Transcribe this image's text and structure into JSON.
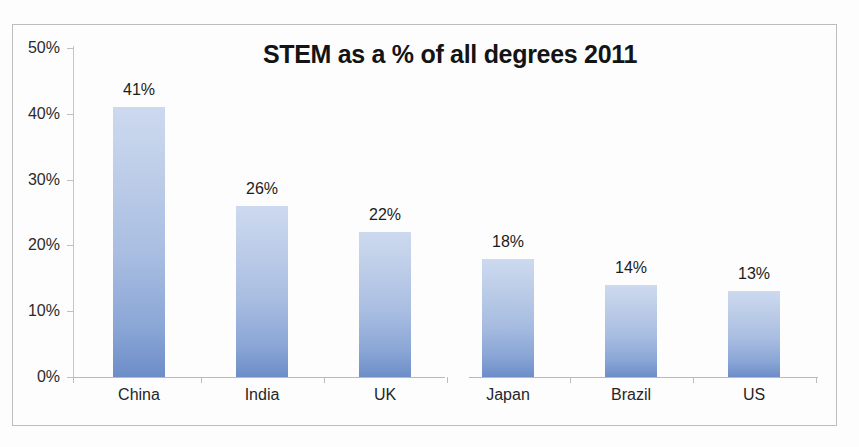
{
  "chart_data": {
    "type": "bar",
    "title": "STEM as a % of all degrees 2011",
    "xlabel": "",
    "ylabel": "",
    "categories": [
      "China",
      "India",
      "UK",
      "Japan",
      "Brazil",
      "US"
    ],
    "values": [
      41,
      26,
      22,
      18,
      14,
      13
    ],
    "data_labels": [
      "41%",
      "26%",
      "22%",
      "18%",
      "14%",
      "13%"
    ],
    "ylim": [
      0,
      50
    ],
    "ytick_values": [
      0,
      10,
      20,
      30,
      40,
      50
    ],
    "ytick_labels": [
      "0%",
      "10%",
      "20%",
      "30%",
      "40%",
      "50%"
    ],
    "value_unit": "%",
    "grid": false,
    "legend": false,
    "legend_position": "none",
    "series": [
      {
        "name": "STEM share of all degrees",
        "values": [
          41,
          26,
          22,
          18,
          14,
          13
        ]
      }
    ],
    "colors": {
      "bar_top": "#ccd9ef",
      "bar_bottom": "#6d8dc8",
      "axis": "#bcbcbc",
      "text": "#1c1c1c",
      "background": "#fdfdfd",
      "frame": "#bdbdbd"
    }
  }
}
